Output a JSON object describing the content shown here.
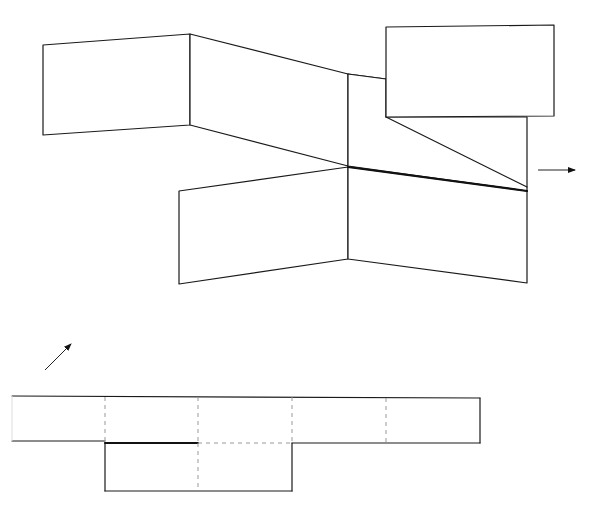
{
  "diagram": {
    "title": "",
    "colors": {
      "stroke": "#1a1a1a",
      "fold_line": "#999999",
      "background": "#ffffff"
    },
    "folded_view": {
      "faces": [
        "left-wing-face",
        "back-slanted-face",
        "top-right-flap",
        "inner-triangle-face",
        "front-left-face",
        "front-right-face"
      ],
      "bold_edge": "front-top-crease",
      "arrow": "right-arrow"
    },
    "net_view": {
      "top_strip_panels": 5,
      "bottom_strip_panels": 2,
      "fold_line_style": "dashed",
      "arrow": "diagonal-up-right-arrow"
    }
  }
}
